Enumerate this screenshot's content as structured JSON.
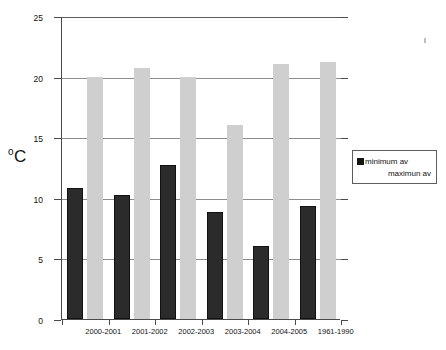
{
  "axis": {
    "y_label": "C",
    "y_label_degree": "o",
    "y_ticks": [
      "0",
      "5",
      "10",
      "15",
      "20",
      "25"
    ]
  },
  "legend": {
    "items": [
      {
        "label": "minimum av",
        "swatch": "black"
      },
      {
        "label": "maximun av",
        "swatch": "none"
      }
    ]
  },
  "chart_data": {
    "type": "bar",
    "title": "",
    "xlabel": "",
    "ylabel": "oC",
    "ylim": [
      0,
      25
    ],
    "yticks": [
      0,
      5,
      10,
      15,
      20,
      25
    ],
    "grid": true,
    "legend_position": "right",
    "categories": [
      "2000-2001",
      "2001-2002",
      "2002-2003",
      "2003-2004",
      "2004-2005",
      "1961-1990"
    ],
    "series": [
      {
        "name": "minimum av",
        "color": "#2b2b2b",
        "values": [
          10.8,
          10.2,
          12.7,
          8.8,
          6.0,
          9.3
        ]
      },
      {
        "name": "maximun av",
        "color": "#cfcfcf",
        "values": [
          20.0,
          20.7,
          20.0,
          16.0,
          21.0,
          21.2
        ]
      }
    ]
  }
}
